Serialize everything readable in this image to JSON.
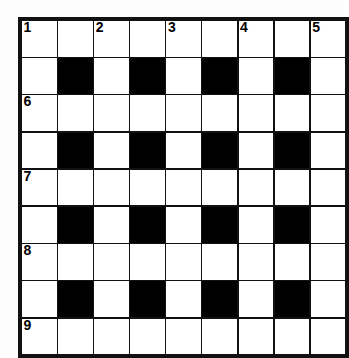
{
  "puzzle": {
    "type": "crossword-grid",
    "rows": 9,
    "columns": 9,
    "cell_size_px": 35,
    "colors": {
      "block": "#000000",
      "open": "#ffffff",
      "rule": "#111111",
      "page_background": "#fdfdfd",
      "number_text": "#000000"
    },
    "numbers_visible": [
      "1",
      "2",
      "3",
      "4",
      "5",
      "6",
      "7",
      "8",
      "9"
    ],
    "grid": [
      [
        {
          "block": false,
          "number": "1",
          "letter": ""
        },
        {
          "block": false,
          "number": "",
          "letter": ""
        },
        {
          "block": false,
          "number": "2",
          "letter": ""
        },
        {
          "block": false,
          "number": "",
          "letter": ""
        },
        {
          "block": false,
          "number": "3",
          "letter": ""
        },
        {
          "block": false,
          "number": "",
          "letter": ""
        },
        {
          "block": false,
          "number": "4",
          "letter": ""
        },
        {
          "block": false,
          "number": "",
          "letter": ""
        },
        {
          "block": false,
          "number": "5",
          "letter": ""
        }
      ],
      [
        {
          "block": false,
          "number": "",
          "letter": ""
        },
        {
          "block": true,
          "number": "",
          "letter": ""
        },
        {
          "block": false,
          "number": "",
          "letter": ""
        },
        {
          "block": true,
          "number": "",
          "letter": ""
        },
        {
          "block": false,
          "number": "",
          "letter": ""
        },
        {
          "block": true,
          "number": "",
          "letter": ""
        },
        {
          "block": false,
          "number": "",
          "letter": ""
        },
        {
          "block": true,
          "number": "",
          "letter": ""
        },
        {
          "block": false,
          "number": "",
          "letter": ""
        }
      ],
      [
        {
          "block": false,
          "number": "6",
          "letter": ""
        },
        {
          "block": false,
          "number": "",
          "letter": ""
        },
        {
          "block": false,
          "number": "",
          "letter": ""
        },
        {
          "block": false,
          "number": "",
          "letter": ""
        },
        {
          "block": false,
          "number": "",
          "letter": ""
        },
        {
          "block": false,
          "number": "",
          "letter": ""
        },
        {
          "block": false,
          "number": "",
          "letter": ""
        },
        {
          "block": false,
          "number": "",
          "letter": ""
        },
        {
          "block": false,
          "number": "",
          "letter": ""
        }
      ],
      [
        {
          "block": false,
          "number": "",
          "letter": ""
        },
        {
          "block": true,
          "number": "",
          "letter": ""
        },
        {
          "block": false,
          "number": "",
          "letter": ""
        },
        {
          "block": true,
          "number": "",
          "letter": ""
        },
        {
          "block": false,
          "number": "",
          "letter": ""
        },
        {
          "block": true,
          "number": "",
          "letter": ""
        },
        {
          "block": false,
          "number": "",
          "letter": ""
        },
        {
          "block": true,
          "number": "",
          "letter": ""
        },
        {
          "block": false,
          "number": "",
          "letter": ""
        }
      ],
      [
        {
          "block": false,
          "number": "7",
          "letter": ""
        },
        {
          "block": false,
          "number": "",
          "letter": ""
        },
        {
          "block": false,
          "number": "",
          "letter": ""
        },
        {
          "block": false,
          "number": "",
          "letter": ""
        },
        {
          "block": false,
          "number": "",
          "letter": ""
        },
        {
          "block": false,
          "number": "",
          "letter": ""
        },
        {
          "block": false,
          "number": "",
          "letter": ""
        },
        {
          "block": false,
          "number": "",
          "letter": ""
        },
        {
          "block": false,
          "number": "",
          "letter": ""
        }
      ],
      [
        {
          "block": false,
          "number": "",
          "letter": ""
        },
        {
          "block": true,
          "number": "",
          "letter": ""
        },
        {
          "block": false,
          "number": "",
          "letter": ""
        },
        {
          "block": true,
          "number": "",
          "letter": ""
        },
        {
          "block": false,
          "number": "",
          "letter": ""
        },
        {
          "block": true,
          "number": "",
          "letter": ""
        },
        {
          "block": false,
          "number": "",
          "letter": ""
        },
        {
          "block": true,
          "number": "",
          "letter": ""
        },
        {
          "block": false,
          "number": "",
          "letter": ""
        }
      ],
      [
        {
          "block": false,
          "number": "8",
          "letter": ""
        },
        {
          "block": false,
          "number": "",
          "letter": ""
        },
        {
          "block": false,
          "number": "",
          "letter": ""
        },
        {
          "block": false,
          "number": "",
          "letter": ""
        },
        {
          "block": false,
          "number": "",
          "letter": ""
        },
        {
          "block": false,
          "number": "",
          "letter": ""
        },
        {
          "block": false,
          "number": "",
          "letter": ""
        },
        {
          "block": false,
          "number": "",
          "letter": ""
        },
        {
          "block": false,
          "number": "",
          "letter": ""
        }
      ],
      [
        {
          "block": false,
          "number": "",
          "letter": ""
        },
        {
          "block": true,
          "number": "",
          "letter": ""
        },
        {
          "block": false,
          "number": "",
          "letter": ""
        },
        {
          "block": true,
          "number": "",
          "letter": ""
        },
        {
          "block": false,
          "number": "",
          "letter": ""
        },
        {
          "block": true,
          "number": "",
          "letter": ""
        },
        {
          "block": false,
          "number": "",
          "letter": ""
        },
        {
          "block": true,
          "number": "",
          "letter": ""
        },
        {
          "block": false,
          "number": "",
          "letter": ""
        }
      ],
      [
        {
          "block": false,
          "number": "9",
          "letter": ""
        },
        {
          "block": false,
          "number": "",
          "letter": ""
        },
        {
          "block": false,
          "number": "",
          "letter": ""
        },
        {
          "block": false,
          "number": "",
          "letter": ""
        },
        {
          "block": false,
          "number": "",
          "letter": ""
        },
        {
          "block": false,
          "number": "",
          "letter": ""
        },
        {
          "block": false,
          "number": "",
          "letter": ""
        },
        {
          "block": false,
          "number": "",
          "letter": ""
        },
        {
          "block": false,
          "number": "",
          "letter": ""
        }
      ]
    ]
  }
}
